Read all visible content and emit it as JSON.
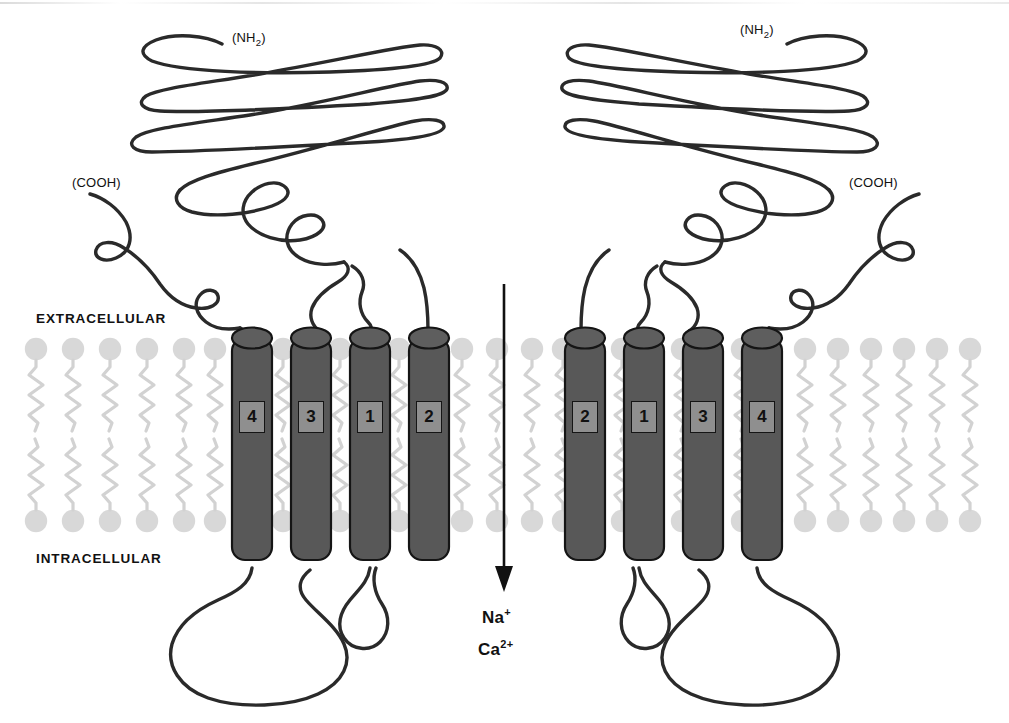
{
  "figure": {
    "type": "membrane-protein-topology-diagram"
  },
  "compartments": {
    "extracellular_label": "EXTRACELLULAR",
    "intracellular_label": "INTRACELLULAR"
  },
  "terminals": {
    "amino": "(NH2)",
    "amino_prefix": "(NH",
    "amino_sub": "2",
    "amino_suffix": ")",
    "carboxyl": "(COOH)"
  },
  "ion_flux": {
    "direction": "downward",
    "ions": [
      {
        "name": "Na",
        "charge": "+"
      },
      {
        "name": "Ca",
        "charge": "2+"
      }
    ]
  },
  "subunits": [
    {
      "id": "left-subunit",
      "side": "left",
      "helix_labels": [
        "4",
        "3",
        "1",
        "2"
      ],
      "nh2_position": "top-center",
      "cooh_position": "left"
    },
    {
      "id": "right-subunit",
      "side": "right",
      "helix_labels": [
        "2",
        "1",
        "3",
        "4"
      ],
      "nh2_position": "top-center",
      "cooh_position": "right"
    }
  ],
  "membrane": {
    "lipid_head_color": "#d8d8d8",
    "lipid_tail_color": "#d2d2d2",
    "leaflets": 2,
    "lipid_columns_total": 30
  },
  "colors": {
    "helix_fill": "#585858",
    "helix_stroke": "#151515",
    "helix_label_box": "#8f8f8f",
    "chain_stroke": "#2a2a2a",
    "background": "#ffffff",
    "text": "#111111"
  }
}
